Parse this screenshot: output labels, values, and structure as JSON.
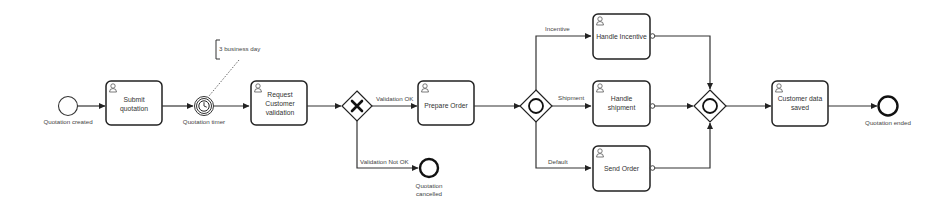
{
  "diagram": {
    "type": "BPMN process",
    "colors": {
      "stroke": "#222222",
      "background": "#ffffff",
      "text": "#444444"
    },
    "events": [
      {
        "id": "start",
        "kind": "start-event",
        "label": "Quotation created"
      },
      {
        "id": "timer",
        "kind": "intermediate-timer-event",
        "label": "Quotation timer"
      },
      {
        "id": "cancelled",
        "kind": "end-event",
        "label_line1": "Quotation",
        "label_line2": "cancelled"
      },
      {
        "id": "ended",
        "kind": "end-event",
        "label": "Quotation ended"
      }
    ],
    "annotation": {
      "text": "3 business day"
    },
    "tasks": [
      {
        "id": "submit",
        "line1": "Submit",
        "line2": "quotation"
      },
      {
        "id": "request",
        "line1": "Request",
        "line2": "Customer",
        "line3": "validation"
      },
      {
        "id": "prepare",
        "line1": "Prepare Order"
      },
      {
        "id": "incentive",
        "line1": "Handle Incentive"
      },
      {
        "id": "shipment",
        "line1": "Handle",
        "line2": "shipment"
      },
      {
        "id": "send",
        "line1": "Send Order"
      },
      {
        "id": "saved",
        "line1": "Customer data",
        "line2": "saved"
      }
    ],
    "gateways": [
      {
        "id": "validation-gw",
        "kind": "exclusive",
        "marker": "X"
      },
      {
        "id": "split-gw",
        "kind": "inclusive"
      },
      {
        "id": "join-gw",
        "kind": "inclusive"
      }
    ],
    "flows": {
      "validation_ok": "Validation OK",
      "validation_not_ok": "Validation Not OK",
      "incentive": "Incentive",
      "shipment": "Shipment",
      "default": "Default"
    }
  }
}
